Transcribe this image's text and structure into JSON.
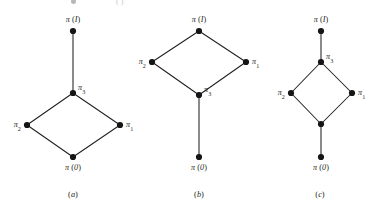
{
  "figure": {
    "width": 375,
    "height": 211,
    "background_color": "#ffffff",
    "ink_color": "#231f20",
    "node_color": "#151515",
    "node_radius": 3.1
  },
  "labels": {
    "pi_top": "π (I)",
    "pi_bottom": "π (0)",
    "pi_1": "π",
    "pi_1_sub": "1",
    "pi_2": "π",
    "pi_2_sub": "2",
    "pi_3": "π",
    "pi_3_sub": "3"
  },
  "captions": {
    "a": "(a)",
    "b": "(b)",
    "c": "(c)",
    "a_letter": "a",
    "b_letter": "b",
    "c_letter": "c"
  },
  "chart_data": {
    "type": "diagram",
    "title": "",
    "panels": [
      {
        "id": "a",
        "caption": "(a)",
        "caption_pos": [
          73,
          194
        ],
        "nodes": [
          {
            "id": "a-top",
            "label": "π (I)",
            "label_kind": "plain",
            "x": 73,
            "y": 31,
            "label_pos": "above"
          },
          {
            "id": "a-pi3",
            "label": "π",
            "sub": "3",
            "label_kind": "sub",
            "x": 73,
            "y": 93,
            "label_pos": "upright"
          },
          {
            "id": "a-pi2",
            "label": "π",
            "sub": "2",
            "label_kind": "sub",
            "x": 27,
            "y": 125,
            "label_pos": "left"
          },
          {
            "id": "a-pi1",
            "label": "π",
            "sub": "1",
            "label_kind": "sub",
            "x": 120,
            "y": 125,
            "label_pos": "right"
          },
          {
            "id": "a-bottom",
            "label": "π (0)",
            "label_kind": "plain",
            "x": 73,
            "y": 157,
            "label_pos": "below"
          }
        ],
        "edges": [
          [
            "a-top",
            "a-pi3"
          ],
          [
            "a-pi3",
            "a-pi2"
          ],
          [
            "a-pi3",
            "a-pi1"
          ],
          [
            "a-pi2",
            "a-bottom"
          ],
          [
            "a-pi1",
            "a-bottom"
          ]
        ]
      },
      {
        "id": "b",
        "caption": "(b)",
        "caption_pos": [
          199,
          194
        ],
        "nodes": [
          {
            "id": "b-top",
            "label": "π (I)",
            "label_kind": "plain",
            "x": 199,
            "y": 31,
            "label_pos": "above"
          },
          {
            "id": "b-pi2",
            "label": "π",
            "sub": "2",
            "label_kind": "sub",
            "x": 152,
            "y": 62,
            "label_pos": "left"
          },
          {
            "id": "b-pi1",
            "label": "π",
            "sub": "1",
            "label_kind": "sub",
            "x": 246,
            "y": 62,
            "label_pos": "right"
          },
          {
            "id": "b-pi3",
            "label": "π",
            "sub": "3",
            "label_kind": "sub",
            "x": 199,
            "y": 95,
            "label_pos": "upright"
          },
          {
            "id": "b-bottom",
            "label": "π (0)",
            "label_kind": "plain",
            "x": 199,
            "y": 157,
            "label_pos": "below"
          }
        ],
        "edges": [
          [
            "b-top",
            "b-pi2"
          ],
          [
            "b-top",
            "b-pi1"
          ],
          [
            "b-pi2",
            "b-pi3"
          ],
          [
            "b-pi1",
            "b-pi3"
          ],
          [
            "b-pi3",
            "b-bottom"
          ]
        ]
      },
      {
        "id": "c",
        "caption": "(c)",
        "caption_pos": [
          320,
          194
        ],
        "nodes": [
          {
            "id": "c-top",
            "label": "π (I)",
            "label_kind": "plain",
            "x": 321,
            "y": 31,
            "label_pos": "above"
          },
          {
            "id": "c-pi3",
            "label": "π",
            "sub": "3",
            "label_kind": "sub",
            "x": 321,
            "y": 62,
            "label_pos": "upright"
          },
          {
            "id": "c-pi2",
            "label": "π",
            "sub": "2",
            "label_kind": "sub",
            "x": 291,
            "y": 93,
            "label_pos": "left"
          },
          {
            "id": "c-pi1",
            "label": "π",
            "sub": "1",
            "label_kind": "sub",
            "x": 352,
            "y": 93,
            "label_pos": "right"
          },
          {
            "id": "c-meet",
            "label": "",
            "label_kind": "none",
            "x": 321,
            "y": 124,
            "label_pos": "none"
          },
          {
            "id": "c-bottom",
            "label": "π (0)",
            "label_kind": "plain",
            "x": 321,
            "y": 157,
            "label_pos": "below"
          }
        ],
        "edges": [
          [
            "c-top",
            "c-pi3"
          ],
          [
            "c-pi3",
            "c-pi2"
          ],
          [
            "c-pi3",
            "c-pi1"
          ],
          [
            "c-pi2",
            "c-meet"
          ],
          [
            "c-pi1",
            "c-meet"
          ],
          [
            "c-meet",
            "c-bottom"
          ]
        ]
      }
    ]
  }
}
